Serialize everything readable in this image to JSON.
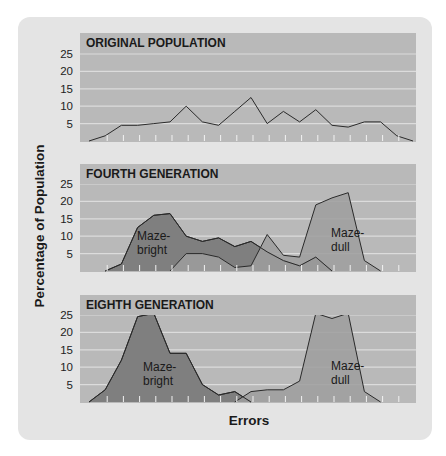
{
  "figure": {
    "ylabel": "Percentage of Population",
    "xlabel": "Errors",
    "colors": {
      "outer_panel": "#e4e4e4",
      "plot_bg": "#b9b9b9",
      "title_band": "#b9b9b9",
      "gridline": "#dcdcdc",
      "bright_fill": "#7f7f7f",
      "dull_fill": "#9e9e9e",
      "line": "#2a2a2a",
      "text": "#1a1a1a"
    }
  },
  "chart_data": [
    {
      "type": "line",
      "title": "ORIGINAL POPULATION",
      "xlabel": "Errors",
      "ylabel": "Percentage of Population",
      "yticks": [
        5,
        10,
        15,
        20,
        25
      ],
      "ylim": [
        0,
        27
      ],
      "grid": true,
      "x": [
        0,
        1,
        2,
        3,
        4,
        5,
        6,
        7,
        8,
        9,
        10,
        11,
        12,
        13,
        14,
        15,
        16,
        17,
        18,
        19,
        20
      ],
      "series": [
        {
          "name": "Original population",
          "values": [
            0,
            1.5,
            4.5,
            4.5,
            5,
            5.5,
            10,
            5.5,
            4.5,
            8.5,
            12.5,
            5,
            8.5,
            5.5,
            9,
            4.5,
            4,
            5.5,
            5.5,
            1.5,
            0
          ]
        }
      ]
    },
    {
      "type": "area",
      "title": "FOURTH GENERATION",
      "xlabel": "Errors",
      "ylabel": "Percentage of Population",
      "yticks": [
        5,
        10,
        15,
        20,
        25
      ],
      "ylim": [
        0,
        27
      ],
      "grid": true,
      "x": [
        0,
        1,
        2,
        3,
        4,
        5,
        6,
        7,
        8,
        9,
        10,
        11,
        12,
        13,
        14,
        15,
        16,
        17,
        18,
        19,
        20
      ],
      "series": [
        {
          "name": "Maze-bright",
          "values": [
            null,
            0,
            2,
            12.5,
            16,
            16.5,
            10,
            8.5,
            9.5,
            7,
            8.5,
            5.5,
            3,
            1.5,
            4,
            0,
            null,
            null,
            null,
            null,
            null
          ]
        },
        {
          "name": "Maze-dull",
          "values": [
            null,
            null,
            null,
            null,
            null,
            0,
            5,
            5,
            4,
            1,
            1.5,
            10.5,
            4.5,
            4,
            19,
            21,
            22.5,
            3,
            0,
            null,
            null
          ]
        }
      ],
      "annotations": [
        {
          "text": "Maze-bright",
          "series": "Maze-bright"
        },
        {
          "text": "Maze-dull",
          "series": "Maze-dull"
        }
      ]
    },
    {
      "type": "area",
      "title": "EIGHTH GENERATION",
      "xlabel": "Errors",
      "ylabel": "Percentage of Population",
      "yticks": [
        5,
        10,
        15,
        20,
        25
      ],
      "ylim": [
        0,
        27
      ],
      "grid": true,
      "x": [
        0,
        1,
        2,
        3,
        4,
        5,
        6,
        7,
        8,
        9,
        10,
        11,
        12,
        13,
        14,
        15,
        16,
        17,
        18,
        19,
        20
      ],
      "series": [
        {
          "name": "Maze-bright",
          "values": [
            0,
            3.5,
            12,
            24.5,
            25.5,
            14,
            14,
            5,
            2,
            3,
            0,
            null,
            null,
            null,
            null,
            null,
            null,
            null,
            null,
            null,
            null
          ]
        },
        {
          "name": "Maze-dull",
          "values": [
            null,
            null,
            null,
            null,
            null,
            null,
            null,
            null,
            null,
            0,
            3,
            3.5,
            3.5,
            6,
            25.5,
            24,
            25.5,
            3,
            0,
            null,
            null
          ]
        }
      ],
      "annotations": [
        {
          "text": "Maze-bright",
          "series": "Maze-bright"
        },
        {
          "text": "Maze-dull",
          "series": "Maze-dull"
        }
      ]
    }
  ],
  "labels": {
    "maze_bright_line1": "Maze-",
    "maze_bright_line2": "bright",
    "maze_dull_line1": "Maze-",
    "maze_dull_line2": "dull"
  }
}
